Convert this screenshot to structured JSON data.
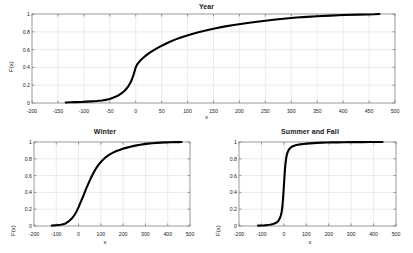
{
  "figure": {
    "background": "#ffffff",
    "line_color": "#000000",
    "grid_color": "#d9d9d9",
    "axis_color": "#808080"
  },
  "chart_data": [
    {
      "type": "line",
      "title": "Year",
      "xlabel": "x",
      "ylabel": "F(x)",
      "xlim": [
        -200,
        500
      ],
      "ylim": [
        0,
        1
      ],
      "xticks": [
        -200,
        -150,
        -100,
        -50,
        0,
        50,
        100,
        150,
        200,
        250,
        300,
        350,
        400,
        450,
        500
      ],
      "xticklabels": [
        "-200",
        "-150",
        "-100",
        "-50",
        "0",
        "50",
        "100",
        "150",
        "200",
        "250",
        "300",
        "350",
        "400",
        "450",
        "500"
      ],
      "yticks": [
        0,
        0.2,
        0.4,
        0.6,
        0.8,
        1
      ],
      "yticklabels": [
        "0",
        "0.2",
        "0.4",
        "0.6",
        "0.8",
        "1"
      ],
      "grid": true,
      "legend": null,
      "series": [
        {
          "name": "Year ECDF",
          "x": [
            -135,
            -125,
            -115,
            -105,
            -95,
            -85,
            -75,
            -65,
            -58,
            -50,
            -44,
            -38,
            -32,
            -27,
            -22,
            -18,
            -14,
            -10,
            -7,
            -4,
            -2,
            0,
            2,
            5,
            9,
            14,
            20,
            27,
            35,
            44,
            54,
            65,
            77,
            90,
            104,
            119,
            135,
            152,
            170,
            189,
            209,
            230,
            250,
            270,
            290,
            310,
            330,
            350,
            375,
            400,
            430,
            460,
            470
          ],
          "y": [
            0.005,
            0.008,
            0.01,
            0.012,
            0.015,
            0.018,
            0.022,
            0.028,
            0.035,
            0.045,
            0.058,
            0.072,
            0.09,
            0.11,
            0.135,
            0.16,
            0.19,
            0.23,
            0.27,
            0.32,
            0.36,
            0.4,
            0.425,
            0.45,
            0.478,
            0.505,
            0.535,
            0.565,
            0.595,
            0.625,
            0.655,
            0.685,
            0.715,
            0.742,
            0.768,
            0.792,
            0.815,
            0.838,
            0.858,
            0.876,
            0.894,
            0.91,
            0.925,
            0.938,
            0.95,
            0.96,
            0.968,
            0.975,
            0.982,
            0.988,
            0.993,
            0.997,
            1.0
          ]
        }
      ]
    },
    {
      "type": "line",
      "title": "Winter",
      "xlabel": "x",
      "ylabel": "F(x)",
      "xlim": [
        -200,
        500
      ],
      "ylim": [
        0,
        1
      ],
      "xticks": [
        -200,
        -100,
        0,
        100,
        200,
        300,
        400,
        500
      ],
      "xticklabels": [
        "-200",
        "-100",
        "0",
        "100",
        "200",
        "300",
        "400",
        "500"
      ],
      "yticks": [
        0,
        0.2,
        0.4,
        0.6,
        0.8,
        1
      ],
      "yticklabels": [
        "0",
        "0.2",
        "0.4",
        "0.6",
        "0.8",
        "1"
      ],
      "grid": true,
      "legend": null,
      "series": [
        {
          "name": "Winter ECDF",
          "x": [
            -120,
            -110,
            -100,
            -90,
            -80,
            -70,
            -62,
            -55,
            -48,
            -40,
            -32,
            -24,
            -16,
            -8,
            0,
            8,
            17,
            26,
            35,
            44,
            53,
            62,
            71,
            80,
            90,
            100,
            110,
            120,
            132,
            144,
            157,
            170,
            184,
            198,
            213,
            228,
            244,
            260,
            277,
            294,
            312,
            330,
            350,
            370,
            390,
            410,
            430,
            450,
            462
          ],
          "y": [
            0.005,
            0.007,
            0.009,
            0.012,
            0.015,
            0.02,
            0.027,
            0.036,
            0.048,
            0.065,
            0.085,
            0.11,
            0.14,
            0.18,
            0.225,
            0.275,
            0.33,
            0.39,
            0.45,
            0.505,
            0.558,
            0.608,
            0.652,
            0.693,
            0.73,
            0.762,
            0.79,
            0.815,
            0.838,
            0.858,
            0.876,
            0.892,
            0.906,
            0.919,
            0.93,
            0.941,
            0.951,
            0.96,
            0.968,
            0.975,
            0.981,
            0.986,
            0.99,
            0.993,
            0.995,
            0.997,
            0.998,
            0.999,
            1.0
          ]
        }
      ]
    },
    {
      "type": "line",
      "title": "Summer and Fall",
      "xlabel": "x",
      "ylabel": "F(x)",
      "xlim": [
        -200,
        500
      ],
      "ylim": [
        0,
        1
      ],
      "xticks": [
        -200,
        -100,
        0,
        100,
        200,
        300,
        400,
        500
      ],
      "xticklabels": [
        "-200",
        "-100",
        "0",
        "100",
        "200",
        "300",
        "400",
        "500"
      ],
      "yticks": [
        0,
        0.2,
        0.4,
        0.6,
        0.8,
        1
      ],
      "yticklabels": [
        "0",
        "0.2",
        "0.4",
        "0.6",
        "0.8",
        "1"
      ],
      "grid": true,
      "legend": null,
      "series": [
        {
          "name": "Summer and Fall ECDF",
          "x": [
            -115,
            -100,
            -88,
            -76,
            -66,
            -57,
            -49,
            -42,
            -36,
            -30,
            -25,
            -21,
            -17,
            -13,
            -10,
            -7,
            -5,
            -3,
            -1,
            1,
            3,
            5,
            7,
            10,
            13,
            17,
            22,
            28,
            35,
            43,
            52,
            62,
            74,
            87,
            101,
            116,
            132,
            150,
            170,
            192,
            215,
            240,
            266,
            294,
            322,
            352,
            382,
            412,
            440
          ],
          "y": [
            0.004,
            0.006,
            0.008,
            0.011,
            0.014,
            0.018,
            0.023,
            0.029,
            0.037,
            0.047,
            0.06,
            0.076,
            0.098,
            0.128,
            0.168,
            0.22,
            0.28,
            0.35,
            0.43,
            0.515,
            0.6,
            0.675,
            0.74,
            0.8,
            0.845,
            0.88,
            0.908,
            0.928,
            0.943,
            0.953,
            0.961,
            0.967,
            0.972,
            0.977,
            0.981,
            0.984,
            0.987,
            0.99,
            0.992,
            0.994,
            0.995,
            0.996,
            0.997,
            0.998,
            0.999,
            0.999,
            1.0,
            1.0,
            1.0
          ]
        }
      ]
    }
  ]
}
